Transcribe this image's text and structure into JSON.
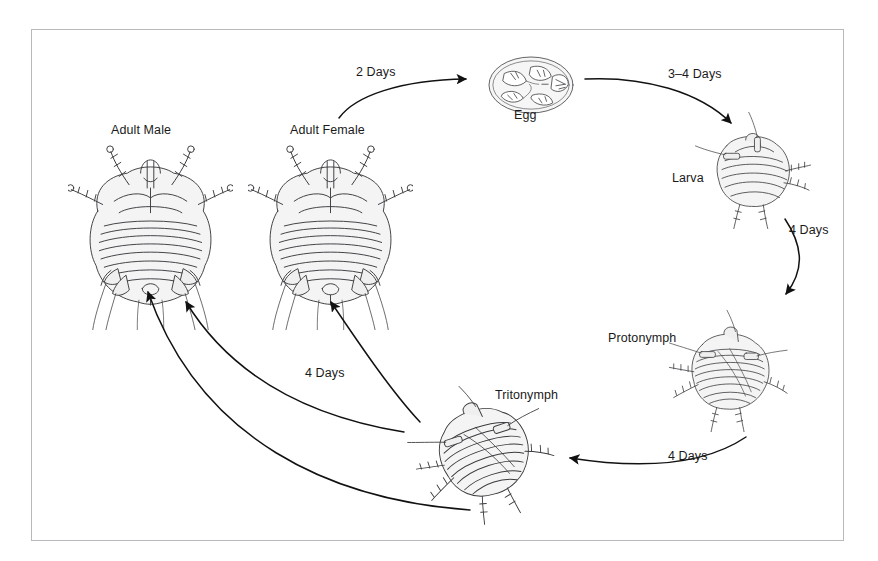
{
  "figure": {
    "kind": "life-cycle-diagram",
    "background_color": "#ffffff",
    "frame_color": "#b9b9bd",
    "ink_color": "#1a1a1a",
    "body_fill": "#f4f4f4"
  },
  "stages": [
    {
      "id": "adult-male",
      "label": "Adult Male",
      "label_x": 111,
      "label_y": 130
    },
    {
      "id": "adult-female",
      "label": "Adult Female",
      "label_x": 290,
      "label_y": 130
    },
    {
      "id": "egg",
      "label": "Egg",
      "label_x": 523,
      "label_y": 114
    },
    {
      "id": "larva",
      "label": "Larva",
      "label_x": 672,
      "label_y": 177
    },
    {
      "id": "protonymph",
      "label": "Protonymph",
      "label_x": 639,
      "label_y": 337
    },
    {
      "id": "tritonymph",
      "label": "Tritonymph",
      "label_x": 495,
      "label_y": 394
    }
  ],
  "transitions": [
    {
      "id": "female-to-egg",
      "from": "adult-female",
      "to": "egg",
      "label": "2 Days",
      "label_x": 356,
      "label_y": 71
    },
    {
      "id": "egg-to-larva",
      "from": "egg",
      "to": "larva",
      "label": "3–4 Days",
      "label_x": 668,
      "label_y": 73
    },
    {
      "id": "larva-to-protonymph",
      "from": "larva",
      "to": "protonymph",
      "label": "4 Days",
      "label_x": 789,
      "label_y": 229
    },
    {
      "id": "protonymph-to-tritonymph",
      "from": "protonymph",
      "to": "tritonymph",
      "label": "4 Days",
      "label_x": 668,
      "label_y": 455
    },
    {
      "id": "tritonymph-to-female",
      "from": "tritonymph",
      "to": "adult-female",
      "label": "4 Days",
      "label_x": 305,
      "label_y": 372
    },
    {
      "id": "tritonymph-to-male-1",
      "from": "tritonymph",
      "to": "adult-male",
      "label": "",
      "label_x": 0,
      "label_y": 0
    },
    {
      "id": "tritonymph-to-male-2",
      "from": "tritonymph",
      "to": "adult-male",
      "label": "",
      "label_x": 0,
      "label_y": 0
    }
  ],
  "footnote": {
    "text": ""
  }
}
